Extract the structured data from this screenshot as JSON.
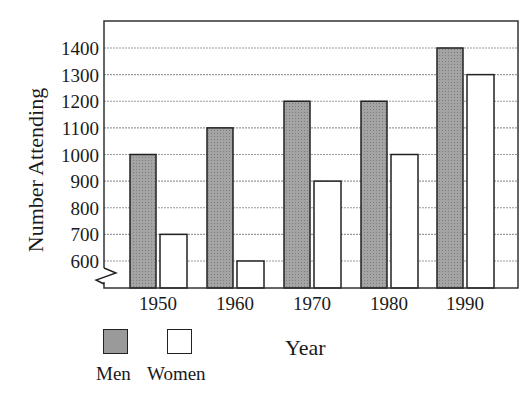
{
  "chart_data": {
    "type": "bar",
    "title": "",
    "xlabel": "Year",
    "ylabel": "Number Attending",
    "categories": [
      "1950",
      "1960",
      "1970",
      "1980",
      "1990"
    ],
    "series": [
      {
        "name": "Men",
        "values": [
          1000,
          1100,
          1200,
          1200,
          1400
        ],
        "color": "#9a9a9a"
      },
      {
        "name": "Women",
        "values": [
          700,
          600,
          900,
          1000,
          1300
        ],
        "color": "#ffffff"
      }
    ],
    "yticks": [
      600,
      700,
      800,
      900,
      1000,
      1100,
      1200,
      1300,
      1400
    ],
    "ylim": [
      500,
      1500
    ],
    "axis_break": true,
    "grid": true,
    "legend_position": "bottom-left"
  },
  "labels": {
    "ylabel": "Number Attending",
    "xlabel": "Year",
    "legend_men": "Men",
    "legend_women": "Women"
  }
}
